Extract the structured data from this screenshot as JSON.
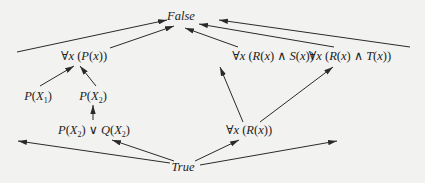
{
  "diagram": {
    "type": "lattice",
    "nodes": [
      {
        "id": "false",
        "html": "<i>False</i>"
      },
      {
        "id": "forall-p",
        "html": "∀<i>x</i> (<i>P</i>(<i>x</i>))"
      },
      {
        "id": "forall-r-and-s",
        "html": "∀<i>x</i> (<i>R</i>(<i>x</i>) ∧ <i>S</i>(<i>x</i>))"
      },
      {
        "id": "forall-r-and-t",
        "html": "∀<i>x</i> (<i>R</i>(<i>x</i>) ∧ <i>T</i>(<i>x</i>))"
      },
      {
        "id": "p-x1",
        "html": "<i>P</i>(<i>X</i><sub>1</sub>)"
      },
      {
        "id": "p-x2",
        "html": "<i>P</i>(<i>X</i><sub>2</sub>)"
      },
      {
        "id": "p-x2-or-q-x2",
        "html": "<i>P</i>(<i>X</i><sub>2</sub>) ∨ <i>Q</i>(<i>X</i><sub>2</sub>)"
      },
      {
        "id": "forall-r",
        "html": "∀<i>x</i> (<i>R</i>(<i>x</i>))"
      },
      {
        "id": "true",
        "html": "<i>True</i>"
      }
    ],
    "edges": [
      {
        "from": "left-stub-top",
        "to": "false"
      },
      {
        "from": "forall-p",
        "to": "false"
      },
      {
        "from": "forall-r-and-s",
        "to": "false"
      },
      {
        "from": "forall-r-and-t",
        "to": "false"
      },
      {
        "from": "right-stub-top",
        "to": "false"
      },
      {
        "from": "p-x1",
        "to": "forall-p"
      },
      {
        "from": "p-x2",
        "to": "forall-p"
      },
      {
        "from": "p-x2-or-q-x2",
        "to": "p-x2"
      },
      {
        "from": "forall-r",
        "to": "forall-r-and-s"
      },
      {
        "from": "forall-r",
        "to": "forall-r-and-t"
      },
      {
        "from": "true",
        "to": "left-stub-bottom"
      },
      {
        "from": "true",
        "to": "p-x2-or-q-x2"
      },
      {
        "from": "true",
        "to": "forall-r"
      },
      {
        "from": "true",
        "to": "right-stub-bottom"
      }
    ]
  }
}
